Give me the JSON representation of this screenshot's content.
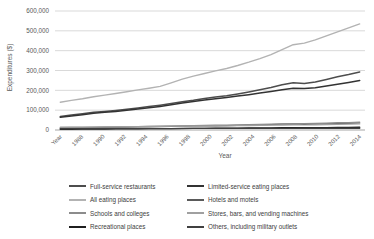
{
  "chart_data": {
    "type": "line",
    "title": "",
    "xlabel": "Year",
    "ylabel": "Expenditures ($)",
    "ylim": [
      0,
      600000
    ],
    "grid": true,
    "legend_position": "bottom",
    "y_ticks": [
      0,
      100000,
      200000,
      300000,
      400000,
      500000,
      600000
    ],
    "y_tick_labels": [
      "0",
      "100,000",
      "200,000",
      "300,000",
      "400,000",
      "500,000",
      "600,000"
    ],
    "x_tick_labels": [
      "Year",
      "1988",
      "1990",
      "1992",
      "1994",
      "1996",
      "1998",
      "2000",
      "2002",
      "2004",
      "2006",
      "2008",
      "2010",
      "2012",
      "2014"
    ],
    "x": [
      1987,
      1988,
      1989,
      1990,
      1991,
      1992,
      1993,
      1994,
      1995,
      1996,
      1997,
      1998,
      1999,
      2000,
      2001,
      2002,
      2003,
      2004,
      2005,
      2006,
      2007,
      2008,
      2009,
      2010,
      2011,
      2012,
      2013,
      2014
    ],
    "series": [
      {
        "name": "Full-service restaurants",
        "color": "#4d4d4d",
        "width": 1.5,
        "values": [
          68000,
          75000,
          82000,
          89000,
          94000,
          99000,
          105000,
          111000,
          118000,
          125000,
          133000,
          142000,
          150000,
          159000,
          166000,
          173000,
          182000,
          192000,
          203000,
          215000,
          228000,
          238000,
          235000,
          242000,
          255000,
          268000,
          280000,
          293000
        ]
      },
      {
        "name": "Limited-service eating places",
        "color": "#333333",
        "width": 1.5,
        "values": [
          64000,
          70000,
          77000,
          84000,
          89000,
          94000,
          100000,
          106000,
          112000,
          119000,
          127000,
          136000,
          144000,
          152000,
          158000,
          164000,
          171000,
          178000,
          186000,
          194000,
          203000,
          210000,
          209000,
          213000,
          222000,
          231000,
          240000,
          249000
        ]
      },
      {
        "name": "All eating places",
        "color": "#b3b3b3",
        "width": 1.4,
        "values": [
          140000,
          149000,
          158000,
          168000,
          176000,
          184000,
          193000,
          202000,
          211000,
          220000,
          238000,
          256000,
          272000,
          285000,
          298000,
          310000,
          325000,
          342000,
          360000,
          380000,
          405000,
          430000,
          438000,
          455000,
          475000,
          495000,
          515000,
          535000
        ]
      },
      {
        "name": "Hotels and motels",
        "color": "#5a5a5a",
        "width": 1.2,
        "values": [
          10000,
          11000,
          11000,
          12000,
          13000,
          13000,
          14000,
          15000,
          16000,
          17000,
          18000,
          19000,
          20000,
          21000,
          21000,
          22000,
          23000,
          24000,
          26000,
          27000,
          29000,
          30000,
          28000,
          29000,
          31000,
          33000,
          34000,
          36000
        ]
      },
      {
        "name": "Schools and colleges",
        "color": "#8c8c8c",
        "width": 1.2,
        "values": [
          12000,
          13000,
          13000,
          14000,
          15000,
          16000,
          16000,
          17000,
          18000,
          19000,
          20000,
          21000,
          22000,
          23000,
          24000,
          25000,
          26000,
          27000,
          28000,
          30000,
          31000,
          32000,
          33000,
          34000,
          35000,
          37000,
          38000,
          40000
        ]
      },
      {
        "name": "Stores, bars, and vending machines",
        "color": "#a0a0a0",
        "width": 1.2,
        "values": [
          14000,
          14000,
          15000,
          15000,
          16000,
          16000,
          17000,
          17000,
          18000,
          18000,
          19000,
          19000,
          20000,
          20000,
          21000,
          21000,
          22000,
          22000,
          23000,
          24000,
          24000,
          25000,
          25000,
          26000,
          27000,
          28000,
          29000,
          30000
        ]
      },
      {
        "name": "Recreational places",
        "color": "#1f1f1f",
        "width": 1.4,
        "values": [
          4000,
          4000,
          5000,
          5000,
          5000,
          6000,
          6000,
          6000,
          7000,
          7000,
          7000,
          8000,
          8000,
          8000,
          9000,
          9000,
          9000,
          10000,
          10000,
          10000,
          11000,
          11000,
          11000,
          12000,
          12000,
          13000,
          13000,
          14000
        ]
      },
      {
        "name": "Others, including military outlets",
        "color": "#404040",
        "width": 1.4,
        "values": [
          6000,
          6000,
          6000,
          6000,
          6000,
          7000,
          7000,
          7000,
          7000,
          7000,
          7000,
          7000,
          8000,
          8000,
          8000,
          8000,
          8000,
          8000,
          8000,
          8000,
          8000,
          8000,
          9000,
          9000,
          9000,
          9000,
          9000,
          9000
        ]
      }
    ]
  },
  "legend": {
    "items": [
      {
        "label": "Full-service restaurants",
        "color": "#4d4d4d"
      },
      {
        "label": "Limited-service eating places",
        "color": "#333333"
      },
      {
        "label": "All eating places",
        "color": "#b3b3b3"
      },
      {
        "label": "Hotels and motels",
        "color": "#5a5a5a"
      },
      {
        "label": "Schools and colleges",
        "color": "#8c8c8c"
      },
      {
        "label": "Stores, bars, and vending machines",
        "color": "#a0a0a0"
      },
      {
        "label": "Recreational places",
        "color": "#1f1f1f"
      },
      {
        "label": "Others, including military outlets",
        "color": "#404040"
      }
    ]
  },
  "colors": {
    "axis_text": "#595959",
    "gridline": "#d9d9d9",
    "axis_line": "#a6a6a6",
    "background": "#ffffff"
  }
}
